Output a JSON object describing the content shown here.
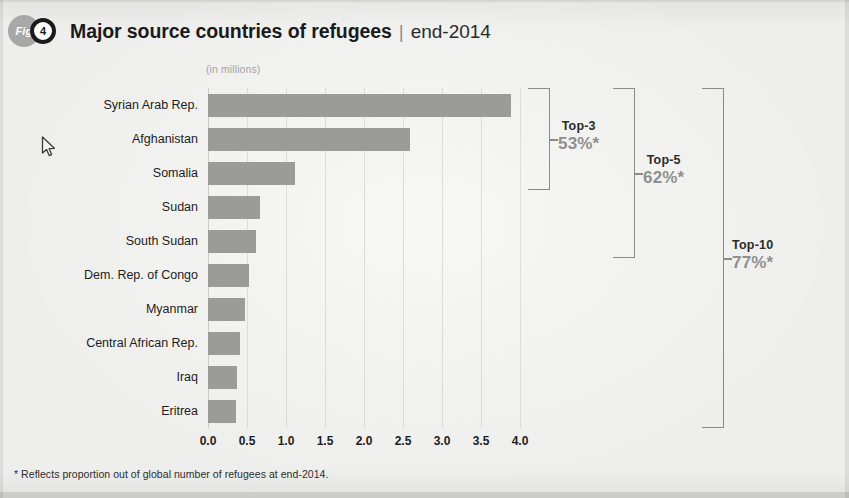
{
  "header": {
    "fig_badge": "Fig",
    "fig_number": "4",
    "title": "Major source countries of refugees",
    "separator": "|",
    "period": "end-2014"
  },
  "units_caption": "(in millions)",
  "footnote": "* Reflects proportion out of global number of refugees at end-2014.",
  "colors": {
    "bar": "#9b9b99",
    "page_background": "#eeeeec",
    "accent_value": "#8f8f8d",
    "bracket": "#8a8a88",
    "text": "#1d1d1d"
  },
  "annotations": [
    {
      "label": "Top-3",
      "value": "53%*",
      "covers": 3
    },
    {
      "label": "Top-5",
      "value": "62%*",
      "covers": 5
    },
    {
      "label": "Top-10",
      "value": "77%*",
      "covers": 10
    }
  ],
  "cursor": {
    "x": 45,
    "y": 143,
    "icon": "mouse-pointer-icon"
  },
  "chart_data": {
    "type": "bar",
    "orientation": "horizontal",
    "title": "Major source countries of refugees | end-2014",
    "subtitle": "(in millions)",
    "xlabel": "",
    "ylabel": "",
    "unit": "millions",
    "xlim": [
      0.0,
      4.0
    ],
    "xticks": [
      "0.0",
      "0.5",
      "1.0",
      "1.5",
      "2.0",
      "2.5",
      "3.0",
      "3.5",
      "4.0"
    ],
    "xtick_values": [
      0.0,
      0.5,
      1.0,
      1.5,
      2.0,
      2.5,
      3.0,
      3.5,
      4.0
    ],
    "grid": "vertical",
    "legend": "none",
    "categories": [
      "Syrian Arab Rep.",
      "Afghanistan",
      "Somalia",
      "Sudan",
      "South Sudan",
      "Dem. Rep. of Congo",
      "Myanmar",
      "Central African Rep.",
      "Iraq",
      "Eritrea"
    ],
    "values": [
      3.88,
      2.59,
      1.11,
      0.67,
      0.62,
      0.52,
      0.48,
      0.41,
      0.37,
      0.36
    ],
    "annotations": [
      {
        "text": "Top-3 53%*",
        "spans_categories": [
          0,
          2
        ]
      },
      {
        "text": "Top-5 62%*",
        "spans_categories": [
          0,
          4
        ]
      },
      {
        "text": "Top-10 77%*",
        "spans_categories": [
          0,
          9
        ]
      }
    ],
    "footnote": "* Reflects proportion out of global number of refugees at end-2014."
  }
}
